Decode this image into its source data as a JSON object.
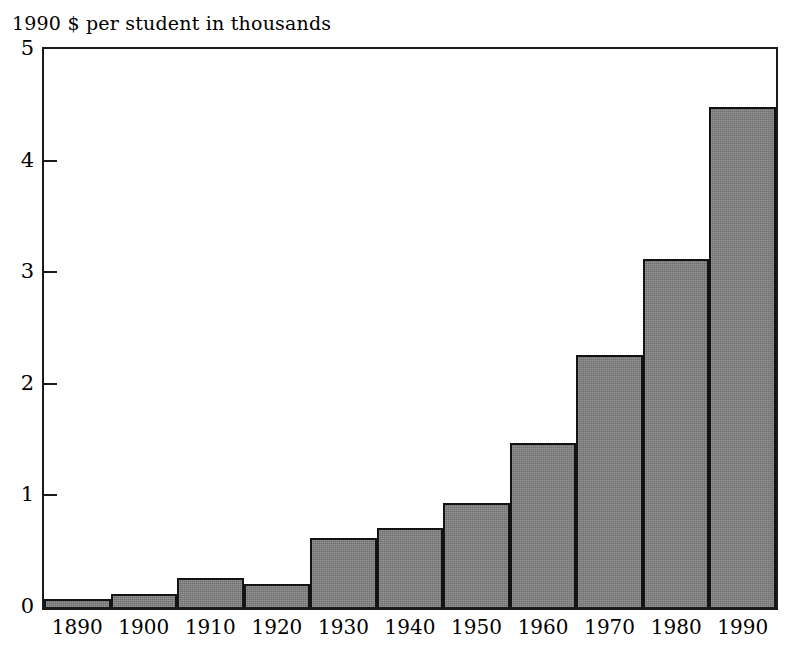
{
  "chart_data": {
    "type": "bar",
    "title": "1990 $ per student in thousands",
    "xlabel": "",
    "ylabel": "1990 $ per student in thousands",
    "categories": [
      "1890",
      "1900",
      "1910",
      "1920",
      "1930",
      "1940",
      "1950",
      "1960",
      "1970",
      "1980",
      "1990"
    ],
    "values": [
      0.07,
      0.12,
      0.26,
      0.21,
      0.62,
      0.71,
      0.93,
      1.47,
      2.26,
      3.12,
      4.48
    ],
    "ylim": [
      0,
      5
    ],
    "yticks": [
      0,
      1,
      2,
      3,
      4,
      5
    ],
    "ytick_labels": [
      "0",
      "1",
      "2",
      "3",
      "4",
      "5"
    ],
    "xtick_labels": [
      "1890",
      "1900",
      "1910",
      "1920",
      "1930",
      "1940",
      "1950",
      "1960",
      "1970",
      "1980",
      "1990"
    ],
    "grid": false,
    "legend": false,
    "bar_fill_color": "#7d7d7d",
    "bar_edge_color": "#131313",
    "axis_color": "#1a1a1a",
    "background_color": "#ffffff"
  }
}
